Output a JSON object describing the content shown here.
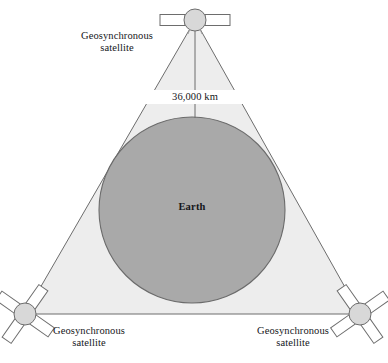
{
  "figure": {
    "type": "diagram",
    "canvas": {
      "width": 388,
      "height": 363,
      "background": "#ffffff"
    }
  },
  "labels": {
    "top_satellite": "Geosynchronous\nsatellite",
    "bottom_left_satellite": "Geosynchronous\nsatellite",
    "bottom_right_satellite": "Geosynchronous\nsatellite",
    "distance": "36,000 km",
    "earth": "Earth"
  },
  "colors": {
    "coverage_fill": "#ededed",
    "coverage_stroke": "#6d6d6d",
    "earth_fill": "#a9a9a9",
    "earth_stroke": "#6b6b6b",
    "satellite_body_fill": "#d8d8d8",
    "satellite_body_stroke": "#6d6d6d",
    "satellite_panel_fill": "#ffffff",
    "satellite_panel_stroke": "#6d6d6d",
    "dimension_line": "#6d6d6d",
    "text": "#15161a"
  },
  "geometry": {
    "triangle_vertices": [
      {
        "name": "top",
        "x": 195,
        "y": 20
      },
      {
        "name": "bottom-left",
        "x": 25,
        "y": 314
      },
      {
        "name": "bottom-right",
        "x": 360,
        "y": 314
      }
    ],
    "earth": {
      "cx": 192,
      "cy": 210,
      "r": 93
    },
    "dimension_line": {
      "x": 195,
      "y1": 31,
      "y2": 117
    },
    "satellites": [
      {
        "name": "top",
        "cx": 195,
        "cy": 20,
        "r": 11,
        "panel_style": "horizontal-pair"
      },
      {
        "name": "bottom-left",
        "cx": 25,
        "cy": 314,
        "r": 11,
        "panel_style": "diagonal-quad"
      },
      {
        "name": "bottom-right",
        "cx": 360,
        "cy": 314,
        "r": 11,
        "panel_style": "diagonal-quad"
      }
    ]
  }
}
